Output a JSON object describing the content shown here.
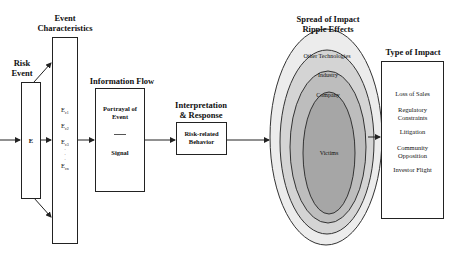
{
  "diagram": {
    "stages": {
      "risk_event": {
        "title_line1": "Risk",
        "title_line2": "Event",
        "box_label": "E"
      },
      "event_characteristics": {
        "title_line1": "Event",
        "title_line2": "Characteristics",
        "items": [
          "Eᶜ1",
          "Eᶜ2",
          "Eᶜ3",
          "·",
          "·",
          "·",
          "Eᶜₙ"
        ],
        "item_labels": {
          "c1": "E",
          "c1_sub": "c1",
          "c2": "E",
          "c2_sub": "c2",
          "c3": "E",
          "c3_sub": "c3",
          "cn": "E",
          "cn_sub": "cn"
        }
      },
      "information_flow": {
        "title": "Information Flow",
        "box_line1": "Portrayal of",
        "box_line2": "Event",
        "divider": "——",
        "box_line3": "Signal"
      },
      "interpretation_response": {
        "title_line1": "Interpretation",
        "title_line2": "& Response",
        "box_line1": "Risk-related",
        "box_line2": "Behavior"
      },
      "spread_of_impact": {
        "title_line1": "Spread of Impact",
        "title_line2": "Ripple Effects",
        "rings": [
          {
            "label": "Other Technologies",
            "fill": "#ececec"
          },
          {
            "label": "Industry",
            "fill": "#d4d4d4"
          },
          {
            "label": "Company",
            "fill": "#bdbdbd"
          },
          {
            "label": "Victims",
            "fill": "#a6a6a6"
          }
        ]
      },
      "type_of_impact": {
        "title": "Type of Impact",
        "items": [
          "Loss of Sales",
          "Regulatory",
          "Constraints",
          "Litigation",
          "Community",
          "Opposition",
          "Investor Flight"
        ]
      }
    },
    "colors": {
      "stroke": "#222222",
      "background": "#ffffff"
    }
  }
}
